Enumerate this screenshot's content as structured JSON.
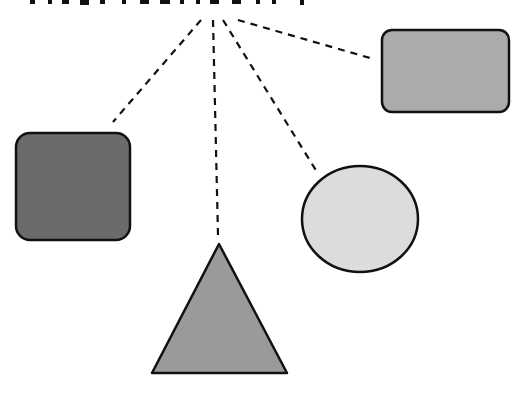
{
  "title": {
    "text": "",
    "note": "cropped heading at top edge, unreadable"
  },
  "colors": {
    "dark_square": "#6b6b6b",
    "right_rect": "#ababab",
    "circle": "#dcdcdc",
    "triangle": "#9a9a9a",
    "stroke": "#111111"
  },
  "shapes": [
    {
      "id": "dark-square",
      "type": "rounded-rect",
      "x": 16,
      "y": 133,
      "w": 114,
      "h": 107
    },
    {
      "id": "right-rect",
      "type": "rounded-rect",
      "x": 382,
      "y": 30,
      "w": 127,
      "h": 82
    },
    {
      "id": "circle",
      "type": "ellipse",
      "cx": 360,
      "cy": 219,
      "rx": 58,
      "ry": 53
    },
    {
      "id": "triangle",
      "type": "triangle",
      "points": "219,244 152,373 287,373"
    }
  ],
  "connectors": [
    {
      "x1": 201,
      "y1": 20,
      "x2": 113,
      "y2": 122
    },
    {
      "x1": 213,
      "y1": 20,
      "x2": 218,
      "y2": 235
    },
    {
      "x1": 223,
      "y1": 20,
      "x2": 317,
      "y2": 172
    },
    {
      "x1": 238,
      "y1": 20,
      "x2": 370,
      "y2": 58
    }
  ]
}
